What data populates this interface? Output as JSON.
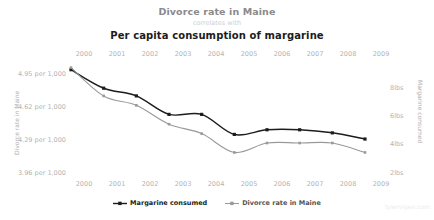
{
  "header": {
    "title": "Divorce rate in Maine",
    "connector": "correlates with",
    "subtitle": "Per capita consumption of margarine"
  },
  "watermark": "tylervigen.com",
  "legend": {
    "items": [
      {
        "label": "Margarine consumed",
        "color": "#1c1c1c",
        "marker": "square-line-marker"
      },
      {
        "label": "Divorce rate in Maine",
        "color": "#999999",
        "marker": "square-line-marker"
      }
    ]
  },
  "chart_data": {
    "type": "line",
    "title": "Divorce rate in Maine correlates with Per capita consumption of margarine",
    "xlabel": "",
    "ylabel": "Divorce rate in Maine",
    "y2label": "Margarine consumed",
    "grid": false,
    "legend_position": "bottom-center",
    "x": [
      2000,
      2001,
      2002,
      2003,
      2004,
      2005,
      2006,
      2007,
      2008,
      2009
    ],
    "x_tick_labels_top": [
      "2000",
      "2001",
      "2002",
      "2003",
      "2004",
      "2005",
      "2006",
      "2007",
      "2008",
      "2009"
    ],
    "x_tick_labels_bottom": [
      "2000",
      "2001",
      "2002",
      "2003",
      "2004",
      "2005",
      "2006",
      "2007",
      "2008",
      "2009"
    ],
    "axes": {
      "left": {
        "tick_labels": [
          "4.95 per 1,000",
          "4.62 per 1,000",
          "4.29 per 1,000",
          "3.96 per 1,000"
        ],
        "tick_values": [
          4.95,
          4.62,
          4.29,
          3.96
        ],
        "ylim": [
          3.85,
          5.06
        ]
      },
      "right": {
        "tick_labels": [
          "8lbs",
          "6lbs",
          "4lbs",
          "2lbs"
        ],
        "tick_values": [
          8,
          6,
          4,
          2
        ],
        "ylim": [
          1.3,
          8.7
        ]
      }
    },
    "series": [
      {
        "name": "Margarine consumed",
        "axis": "right",
        "unit": "lbs",
        "color": "#1c1c1c",
        "values": [
          8.2,
          7.0,
          6.5,
          5.3,
          5.3,
          4.0,
          4.3,
          4.3,
          4.1,
          3.7
        ]
      },
      {
        "name": "Divorce rate in Maine",
        "axis": "left",
        "unit": "per 1,000",
        "color": "#999999",
        "values": [
          5.0,
          4.7,
          4.6,
          4.4,
          4.3,
          4.1,
          4.2,
          4.2,
          4.2,
          4.1
        ]
      }
    ]
  },
  "ticks": {
    "left": [
      {
        "label": "4.95 per 1,000",
        "top": 70
      },
      {
        "label": "4.62 per 1,000",
        "top": 103
      },
      {
        "label": "4.29 per 1,000",
        "top": 136
      },
      {
        "label": "3.96 per 1,000",
        "top": 169
      }
    ],
    "right": [
      {
        "label": "8lbs",
        "top": 84
      },
      {
        "label": "6lbs",
        "top": 112
      },
      {
        "label": "4lbs",
        "top": 140
      },
      {
        "label": "2lbs",
        "top": 169
      }
    ],
    "years_top": [
      {
        "label": "2000",
        "left": 69
      },
      {
        "label": "2001",
        "left": 102
      },
      {
        "label": "2002",
        "left": 135
      },
      {
        "label": "2003",
        "left": 168
      },
      {
        "label": "2004",
        "left": 201
      },
      {
        "label": "2005",
        "left": 234
      },
      {
        "label": "2006",
        "left": 267
      },
      {
        "label": "2007",
        "left": 300
      },
      {
        "label": "2008",
        "left": 333
      },
      {
        "label": "2009",
        "left": 366
      }
    ],
    "years_bottom": [
      {
        "label": "2000",
        "left": 69
      },
      {
        "label": "2001",
        "left": 102
      },
      {
        "label": "2002",
        "left": 135
      },
      {
        "label": "2003",
        "left": 168
      },
      {
        "label": "2004",
        "left": 201
      },
      {
        "label": "2005",
        "left": 234
      },
      {
        "label": "2006",
        "left": 267
      },
      {
        "label": "2007",
        "left": 300
      },
      {
        "label": "2008",
        "left": 333
      },
      {
        "label": "2009",
        "left": 366
      }
    ]
  }
}
